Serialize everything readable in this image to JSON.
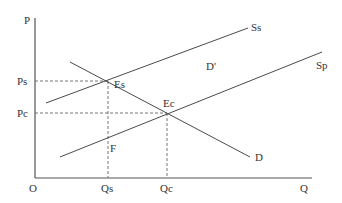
{
  "diagram": {
    "type": "supply-demand",
    "colors": {
      "line": "#4a4a4a",
      "axis": "#555555",
      "text": "#333333",
      "background": "#ffffff"
    },
    "axes": {
      "y_label": "P",
      "x_label": "Q",
      "origin_label": "O",
      "y_ticks": [
        {
          "label": "Ps"
        },
        {
          "label": "Pc"
        }
      ],
      "x_ticks": [
        {
          "label": "Qs"
        },
        {
          "label": "Qc"
        }
      ]
    },
    "curves": [
      {
        "id": "Ss",
        "label": "Ss",
        "kind": "supply"
      },
      {
        "id": "Sp",
        "label": "Sp",
        "kind": "supply"
      },
      {
        "id": "D",
        "label": "D",
        "kind": "demand"
      }
    ],
    "points": [
      {
        "id": "Es",
        "label": "Es"
      },
      {
        "id": "Ec",
        "label": "Ec"
      },
      {
        "id": "F",
        "label": "F"
      }
    ],
    "annotations": [
      {
        "id": "D-prime",
        "label": "D'"
      }
    ]
  }
}
